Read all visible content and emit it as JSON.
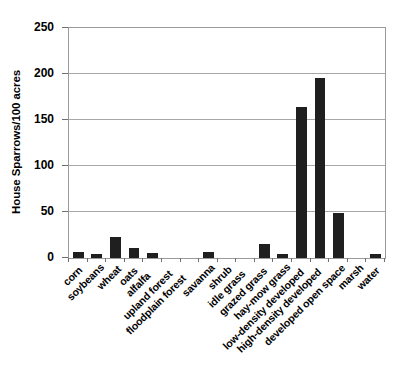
{
  "chart_data": {
    "type": "bar",
    "title": "",
    "xlabel": "",
    "ylabel": "House Sparrows/100 acres",
    "ylim": [
      0,
      250
    ],
    "yticks": [
      0,
      50,
      100,
      150,
      200,
      250
    ],
    "grid": true,
    "legend": "none",
    "bar_color": "#1f1f1f",
    "categories": [
      "corn",
      "soybeans",
      "wheat",
      "oats",
      "alfalfa",
      "upland forest",
      "floodplain forest",
      "savanna",
      "shrub",
      "idle grass",
      "grazed grass",
      "hay-mow grass",
      "low-density developed",
      "high-density developed",
      "developed open space",
      "marsh",
      "water"
    ],
    "values": [
      6,
      4,
      23,
      11,
      5,
      0,
      0,
      7,
      0,
      0,
      15,
      4,
      164,
      196,
      49,
      0,
      4
    ]
  }
}
